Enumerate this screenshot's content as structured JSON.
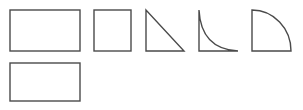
{
  "canvas": {
    "width": 303,
    "height": 110,
    "background": "#ffffff",
    "stroke_color": "#4a4a4a"
  },
  "shapes": [
    {
      "id": "rectangle-1",
      "type": "rectangle",
      "x": 10,
      "y": 10,
      "width": 70,
      "height": 41
    },
    {
      "id": "square",
      "type": "square",
      "x": 94,
      "y": 10,
      "width": 37,
      "height": 41
    },
    {
      "id": "right-triangle",
      "type": "right-triangle",
      "x": 146,
      "y": 10,
      "width": 38,
      "height": 41
    },
    {
      "id": "concave-curve-corner",
      "type": "concave-quarter",
      "x": 199,
      "y": 10,
      "width": 39,
      "height": 41
    },
    {
      "id": "quarter-circle",
      "type": "convex-quarter",
      "x": 252,
      "y": 10,
      "width": 39,
      "height": 41
    },
    {
      "id": "rectangle-2",
      "type": "rectangle",
      "x": 10,
      "y": 63,
      "width": 70,
      "height": 38
    }
  ]
}
